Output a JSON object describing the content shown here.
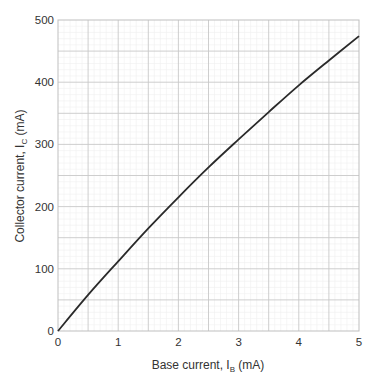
{
  "chart_data": {
    "type": "line",
    "title": "",
    "xlabel": "Base current, I_B (mA)",
    "xlabel_main": "Base current, I",
    "xlabel_sub": "B",
    "xlabel_tail": " (mA)",
    "ylabel": "Collector current, I_C (mA)",
    "ylabel_main": "Collector current, I",
    "ylabel_sub": "C",
    "ylabel_tail": " (mA)",
    "xlim": [
      0,
      5
    ],
    "ylim": [
      0,
      500
    ],
    "xticks": [
      "0",
      "1",
      "2",
      "3",
      "4",
      "5"
    ],
    "yticks": [
      "0",
      "100",
      "200",
      "300",
      "400",
      "500"
    ],
    "grid": true,
    "legend": null,
    "series": [
      {
        "name": "I_C vs I_B",
        "x": [
          0,
          0.5,
          1.0,
          1.5,
          2.0,
          2.5,
          3.0,
          3.5,
          4.0,
          4.5,
          5.0
        ],
        "y": [
          0,
          58,
          112,
          165,
          215,
          263,
          308,
          352,
          395,
          435,
          474
        ]
      }
    ]
  }
}
